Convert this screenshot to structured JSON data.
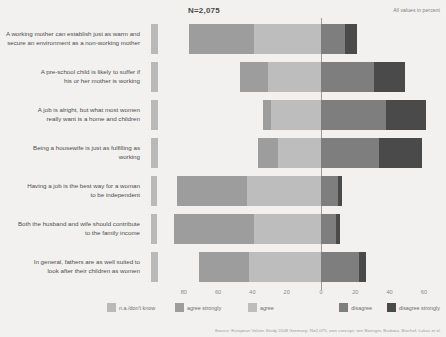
{
  "header": {
    "n_label": "N=2,075",
    "unit_note": "All values in percent"
  },
  "source_note": "Source: European Values Study 2008 Germany; N=2,075; own concept; see Baringer, Barbara, Bischof, Lukas et al.",
  "chart_data": {
    "type": "bar",
    "orientation": "horizontal",
    "stacked": true,
    "diverging": true,
    "title": "",
    "subtitle": "N=2,075",
    "xlabel": "",
    "ylabel": "",
    "xlim": [
      -90,
      70
    ],
    "grid": false,
    "legend_position": "bottom",
    "zero_reference": 0,
    "axis_ticks": [
      {
        "label": "80",
        "value": -80
      },
      {
        "label": "60",
        "value": -60
      },
      {
        "label": "40",
        "value": -40
      },
      {
        "label": "20",
        "value": -20
      },
      {
        "label": "0",
        "value": 0
      },
      {
        "label": "20",
        "value": 20
      },
      {
        "label": "40",
        "value": 40
      },
      {
        "label": "60",
        "value": 60
      }
    ],
    "legend": [
      {
        "name": "n.a./don't know",
        "color": "#b9b9b9"
      },
      {
        "name": "agree strongly",
        "color": "#9d9d9d"
      },
      {
        "name": "agree",
        "color": "#bdbdbd"
      },
      {
        "name": "disagree",
        "color": "#7e7e7e"
      },
      {
        "name": "disagree strongly",
        "color": "#4a4a4a"
      }
    ],
    "categories": [
      "A working mother can establish just as warm and secure an environment as a non-working mother",
      "A pre-school child is likely to suffer if his or her mother is working",
      "A job is alright, but what most women really want is a home and children",
      "Being a housewife is just as fulfilling as working",
      "Having a job is the best way for a woman to be independent",
      "Both the husband and wife should contribute to the family income",
      "In general, fathers are as well suited to look after their children as women"
    ],
    "series": [
      {
        "name": "n.a./don't know",
        "values": [
          4,
          4,
          5,
          5,
          3,
          3,
          4
        ]
      },
      {
        "name": "agree strongly",
        "values": [
          38,
          16,
          5,
          12,
          41,
          47,
          29
        ]
      },
      {
        "name": "agree",
        "values": [
          39,
          31,
          29,
          25,
          43,
          39,
          42
        ]
      },
      {
        "name": "disagree",
        "values": [
          14,
          31,
          38,
          34,
          10,
          9,
          22
        ]
      },
      {
        "name": "disagree strongly",
        "values": [
          7,
          18,
          23,
          25,
          2,
          2,
          4
        ]
      }
    ],
    "rows": [
      {
        "label_line1": "A working mother can establish just as warm and",
        "label_line2": "secure an environment as a non-working mother",
        "na": 4,
        "agree_strongly": 38,
        "agree": 39,
        "disagree": 14,
        "disagree_strongly": 7
      },
      {
        "label_line1": "A pre-school child is likely to suffer if",
        "label_line2": "his or her mother is working",
        "na": 4,
        "agree_strongly": 16,
        "agree": 31,
        "disagree": 31,
        "disagree_strongly": 18
      },
      {
        "label_line1": "A job is alright, but what most women",
        "label_line2": "really want is a home and children",
        "na": 5,
        "agree_strongly": 5,
        "agree": 29,
        "disagree": 38,
        "disagree_strongly": 23
      },
      {
        "label_line1": "Being a housewife is just as fulfilling as",
        "label_line2": "working",
        "na": 5,
        "agree_strongly": 12,
        "agree": 25,
        "disagree": 34,
        "disagree_strongly": 25
      },
      {
        "label_line1": "Having a job is the best way for a woman",
        "label_line2": "to be independent",
        "na": 3,
        "agree_strongly": 41,
        "agree": 43,
        "disagree": 10,
        "disagree_strongly": 2
      },
      {
        "label_line1": "Both the husband and wife should contribute",
        "label_line2": "to the family income",
        "na": 3,
        "agree_strongly": 47,
        "agree": 39,
        "disagree": 9,
        "disagree_strongly": 2
      },
      {
        "label_line1": "In general, fathers are as well suited to",
        "label_line2": "look after their children as women",
        "na": 4,
        "agree_strongly": 29,
        "agree": 42,
        "disagree": 22,
        "disagree_strongly": 4
      }
    ]
  }
}
